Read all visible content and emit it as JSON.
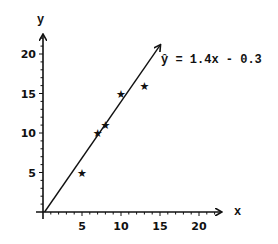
{
  "chart_data": {
    "type": "scatter",
    "title": "",
    "xlabel": "x",
    "ylabel": "y",
    "xlim": [
      0,
      22
    ],
    "ylim": [
      0,
      22
    ],
    "x_ticks": [
      5,
      10,
      15,
      20
    ],
    "y_ticks": [
      5,
      10,
      15,
      20
    ],
    "minor_tick_step": 1,
    "grid": false,
    "legend": null,
    "series": [
      {
        "name": "observations",
        "marker": "star",
        "points": [
          {
            "x": 5,
            "y": 5
          },
          {
            "x": 7,
            "y": 10
          },
          {
            "x": 8,
            "y": 11
          },
          {
            "x": 10,
            "y": 15
          },
          {
            "x": 13,
            "y": 16
          }
        ]
      },
      {
        "name": "regression line",
        "type": "line",
        "equation": "ŷ = 1.4x - 0.3",
        "slope": 1.4,
        "intercept": -0.3,
        "x_range": [
          0.2,
          15
        ]
      }
    ],
    "annotations": [
      {
        "text": "ŷ = 1.4x - 0.3",
        "anchor": "end of regression line"
      }
    ]
  },
  "labels": {
    "x_axis": "x",
    "y_axis": "y",
    "x_ticks": [
      "5",
      "10",
      "15",
      "20"
    ],
    "y_ticks": [
      "5",
      "10",
      "15",
      "20"
    ],
    "equation": "ŷ = 1.4x - 0.3",
    "marker_glyph": "★"
  },
  "colors": {
    "ink": "#111111",
    "background": "#ffffff"
  }
}
